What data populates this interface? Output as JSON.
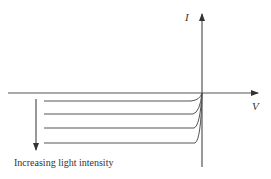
{
  "diagram": {
    "axes": {
      "x_label": "V",
      "y_label": "I"
    },
    "caption": "Increasing light intensity",
    "curves": [
      {
        "name": "curve-1",
        "level": 1
      },
      {
        "name": "curve-2",
        "level": 2
      },
      {
        "name": "curve-3",
        "level": 3
      },
      {
        "name": "curve-4",
        "level": 4
      }
    ],
    "colors": {
      "line": "#444444",
      "background": "#ffffff"
    }
  }
}
